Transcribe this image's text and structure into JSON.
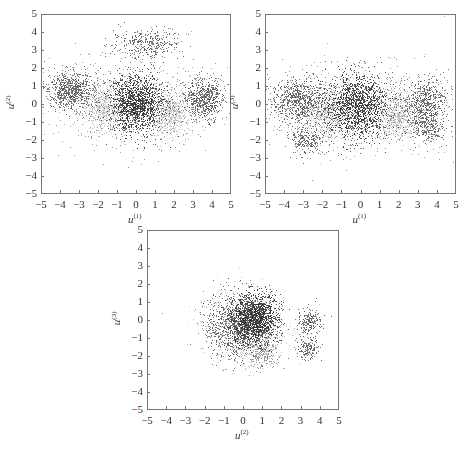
{
  "figure": {
    "panels": [
      {
        "id": "p12",
        "xlabel": "u",
        "xsup": "(1)",
        "ylabel": "u",
        "ysup": "(2)"
      },
      {
        "id": "p13",
        "xlabel": "u",
        "xsup": "(1)",
        "ylabel": "u",
        "ysup": "(3)"
      },
      {
        "id": "p23",
        "xlabel": "u",
        "xsup": "(2)",
        "ylabel": "u",
        "ysup": "(3)"
      }
    ],
    "ticks": [
      "-5",
      "-4",
      "-3",
      "-2",
      "-1",
      "0",
      "1",
      "2",
      "3",
      "4",
      "5"
    ]
  },
  "chart_data": [
    {
      "type": "scatter",
      "title": "",
      "xlabel": "u(1)",
      "ylabel": "u(2)",
      "xlim": [
        -5,
        5
      ],
      "ylim": [
        -5,
        5
      ],
      "xticks": [
        -5,
        -4,
        -3,
        -2,
        -1,
        0,
        1,
        2,
        3,
        4,
        5
      ],
      "yticks": [
        -5,
        -4,
        -3,
        -2,
        -1,
        0,
        1,
        2,
        3,
        4,
        5
      ],
      "grid": false,
      "clusters": [
        {
          "center": [
            -3.5,
            0.8
          ],
          "spread": [
            0.6,
            0.5
          ],
          "shade": "dark",
          "n": 700
        },
        {
          "center": [
            0.0,
            0.0
          ],
          "spread": [
            0.7,
            0.8
          ],
          "shade": "darkest",
          "n": 1400
        },
        {
          "center": [
            3.6,
            0.3
          ],
          "spread": [
            0.5,
            0.6
          ],
          "shade": "dark",
          "n": 600
        },
        {
          "center": [
            0.5,
            3.4
          ],
          "spread": [
            0.9,
            0.4
          ],
          "shade": "dark",
          "n": 350
        },
        {
          "center": [
            -1.8,
            -0.2
          ],
          "spread": [
            0.6,
            0.6
          ],
          "shade": "light",
          "n": 500
        },
        {
          "center": [
            1.9,
            -0.6
          ],
          "spread": [
            0.5,
            0.6
          ],
          "shade": "light",
          "n": 500
        },
        {
          "center": [
            0.0,
            0.0
          ],
          "spread": [
            2.2,
            1.2
          ],
          "shade": "medium",
          "n": 900
        }
      ]
    },
    {
      "type": "scatter",
      "title": "",
      "xlabel": "u(1)",
      "ylabel": "u(3)",
      "xlim": [
        -5,
        5
      ],
      "ylim": [
        -5,
        5
      ],
      "xticks": [
        -5,
        -4,
        -3,
        -2,
        -1,
        0,
        1,
        2,
        3,
        4,
        5
      ],
      "yticks": [
        -5,
        -4,
        -3,
        -2,
        -1,
        0,
        1,
        2,
        3,
        4,
        5
      ],
      "grid": false,
      "clusters": [
        {
          "center": [
            -3.3,
            0.2
          ],
          "spread": [
            0.7,
            0.6
          ],
          "shade": "dark",
          "n": 700
        },
        {
          "center": [
            -2.9,
            -2.0
          ],
          "spread": [
            0.5,
            0.4
          ],
          "shade": "dark",
          "n": 250
        },
        {
          "center": [
            -0.2,
            -0.1
          ],
          "spread": [
            0.8,
            0.9
          ],
          "shade": "darkest",
          "n": 1400
        },
        {
          "center": [
            3.4,
            0.2
          ],
          "spread": [
            0.6,
            0.6
          ],
          "shade": "dark",
          "n": 500
        },
        {
          "center": [
            3.5,
            -1.2
          ],
          "spread": [
            0.5,
            0.5
          ],
          "shade": "dark",
          "n": 300
        },
        {
          "center": [
            -1.8,
            -0.5
          ],
          "spread": [
            0.6,
            0.6
          ],
          "shade": "light",
          "n": 500
        },
        {
          "center": [
            1.9,
            -0.7
          ],
          "spread": [
            0.5,
            0.6
          ],
          "shade": "light",
          "n": 500
        },
        {
          "center": [
            0.0,
            -0.2
          ],
          "spread": [
            2.3,
            1.2
          ],
          "shade": "medium",
          "n": 900
        }
      ]
    },
    {
      "type": "scatter",
      "title": "",
      "xlabel": "u(2)",
      "ylabel": "u(3)",
      "xlim": [
        -5,
        5
      ],
      "ylim": [
        -5,
        5
      ],
      "xticks": [
        -5,
        -4,
        -3,
        -2,
        -1,
        0,
        1,
        2,
        3,
        4,
        5
      ],
      "yticks": [
        -5,
        -4,
        -3,
        -2,
        -1,
        0,
        1,
        2,
        3,
        4,
        5
      ],
      "grid": false,
      "clusters": [
        {
          "center": [
            0.6,
            0.1
          ],
          "spread": [
            0.6,
            0.7
          ],
          "shade": "darkest",
          "n": 1400
        },
        {
          "center": [
            -0.4,
            -0.3
          ],
          "spread": [
            0.8,
            0.9
          ],
          "shade": "dark",
          "n": 1000
        },
        {
          "center": [
            1.0,
            -1.8
          ],
          "spread": [
            0.4,
            0.5
          ],
          "shade": "medium",
          "n": 250
        },
        {
          "center": [
            3.5,
            -0.1
          ],
          "spread": [
            0.3,
            0.4
          ],
          "shade": "dark",
          "n": 200
        },
        {
          "center": [
            3.4,
            -1.6
          ],
          "spread": [
            0.3,
            0.3
          ],
          "shade": "dark",
          "n": 150
        },
        {
          "center": [
            0.2,
            -0.4
          ],
          "spread": [
            1.0,
            1.0
          ],
          "shade": "light",
          "n": 800
        }
      ]
    }
  ]
}
